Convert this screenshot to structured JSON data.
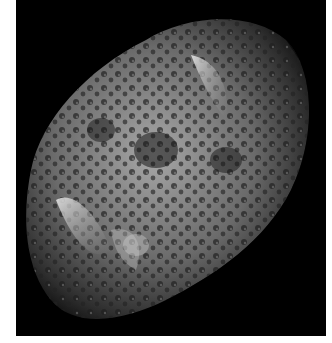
{
  "image": {
    "alt": "Saturn's moon Hyperion, a sponge-like cratered irregular body on black space background",
    "colors": {
      "background": "#ffffff",
      "space": "#000000",
      "surface_light": "#d8d8d8",
      "surface_mid": "#8a8a8a",
      "surface_dark": "#2a2a2a"
    }
  }
}
